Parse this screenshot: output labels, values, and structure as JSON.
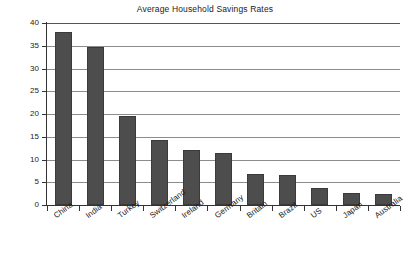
{
  "chart_data": {
    "type": "bar",
    "title": "Average Household Savings Rates",
    "xlabel": "",
    "ylabel": "% of Household Income",
    "categories": [
      "China",
      "India",
      "Turkey",
      "Switzerland",
      "Ireland",
      "Germany",
      "Britain",
      "Brazil",
      "US",
      "Japan",
      "Australia"
    ],
    "values": [
      38.0,
      34.7,
      19.5,
      14.2,
      12.0,
      11.5,
      6.9,
      6.6,
      3.8,
      2.6,
      2.4
    ],
    "ylim": [
      0,
      40
    ],
    "ytick_labels": [
      "0",
      "5",
      "10",
      "15",
      "20",
      "25",
      "30",
      "35",
      "40"
    ],
    "ytick_values": [
      0,
      5,
      10,
      15,
      20,
      25,
      30,
      35,
      40
    ],
    "grid": "horizontal",
    "legend": "none",
    "bar_color": "#4d4d4d",
    "grid_color": "#8c8c8c",
    "axis_color": "#333333",
    "background": "#ffffff"
  }
}
